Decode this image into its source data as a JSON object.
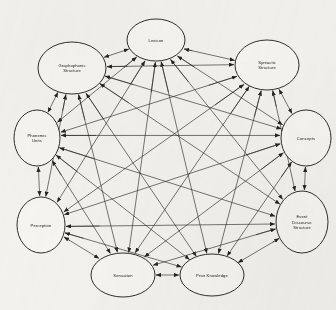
{
  "diagram": {
    "type": "node-graph",
    "background_color": "#f4f2ee",
    "node_fill": "#f7f5f2",
    "node_stroke": "#1a1a1a",
    "edge_color": "#242424",
    "connectivity": "complete-bidirectional",
    "node_count": 10,
    "nodes": [
      {
        "id": "lexicon",
        "label": "Lexicon",
        "lines": [
          "Lexicon"
        ],
        "cx": 156,
        "cy": 40,
        "rx": 29,
        "ry": 21
      },
      {
        "id": "graphophonic",
        "label": "Graphophonic Structure",
        "lines": [
          "Graphophonic",
          "Structure"
        ],
        "cx": 72,
        "cy": 68,
        "rx": 34,
        "ry": 26
      },
      {
        "id": "syntactic",
        "label": "Syntactic Structure",
        "lines": [
          "Syntactic",
          "Structure"
        ],
        "cx": 267,
        "cy": 65,
        "rx": 32,
        "ry": 25
      },
      {
        "id": "phonemic",
        "label": "Phonemic Units",
        "lines": [
          "Phonemic",
          "Units"
        ],
        "cx": 37,
        "cy": 138,
        "rx": 23,
        "ry": 28
      },
      {
        "id": "concepts",
        "label": "Concepts",
        "lines": [
          "Concepts"
        ],
        "cx": 306,
        "cy": 138,
        "rx": 25,
        "ry": 28
      },
      {
        "id": "perception",
        "label": "Perception",
        "lines": [
          "Perception"
        ],
        "cx": 41,
        "cy": 225,
        "rx": 24,
        "ry": 28
      },
      {
        "id": "event_discourse",
        "label": "Event Discourse Structure",
        "lines": [
          "Event",
          "Discourse",
          "Structure"
        ],
        "cx": 302,
        "cy": 222,
        "rx": 26,
        "ry": 31
      },
      {
        "id": "sensation",
        "label": "Sensation",
        "lines": [
          "Sensation"
        ],
        "cx": 123,
        "cy": 275,
        "rx": 32,
        "ry": 22
      },
      {
        "id": "prior_knowledge",
        "label": "Prior Knowledge",
        "lines": [
          "Prior Knowledge"
        ],
        "cx": 212,
        "cy": 275,
        "rx": 32,
        "ry": 21
      }
    ]
  }
}
